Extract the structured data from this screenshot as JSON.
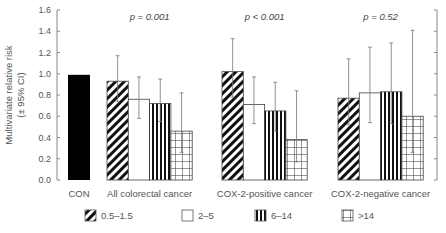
{
  "chart_data": {
    "type": "bar",
    "title": "",
    "xlabel": "",
    "ylabel": "Multivariate relative risk (± 95% CI)",
    "ylabel_lines": [
      "Multivariate relative risk",
      "(± 95% CI)"
    ],
    "ylim": [
      0,
      1.6
    ],
    "yticks": [
      "0.0",
      "0.2",
      "0.4",
      "0.6",
      "0.8",
      "1.0",
      "1.2",
      "1.4",
      "1.6"
    ],
    "grid": false,
    "legend_position": "bottom",
    "reference": {
      "name": "CON",
      "value": 0.99,
      "color": "#000000"
    },
    "categories": [
      "All colorectal cancer",
      "COX-2-positive cancer",
      "COX-2-negative cancer"
    ],
    "annotations": [
      "p = 0.001",
      "p < 0.001",
      "p = 0.52"
    ],
    "series": [
      {
        "name": "0.5–1.5",
        "pattern": "diagonal-hatch",
        "values": [
          0.93,
          1.02,
          0.77
        ],
        "ci_lower": [
          0.74,
          0.78,
          0.52
        ],
        "ci_upper": [
          1.17,
          1.33,
          1.14
        ]
      },
      {
        "name": "2–5",
        "pattern": "white",
        "values": [
          0.76,
          0.71,
          0.82
        ],
        "ci_lower": [
          0.58,
          0.53,
          0.54
        ],
        "ci_upper": [
          0.97,
          0.97,
          1.25
        ]
      },
      {
        "name": "6–14",
        "pattern": "vertical-stripes",
        "values": [
          0.72,
          0.65,
          0.83
        ],
        "ci_lower": [
          0.55,
          0.46,
          0.53
        ],
        "ci_upper": [
          0.95,
          0.92,
          1.29
        ]
      },
      {
        "name": ">14",
        "pattern": "grid",
        "values": [
          0.46,
          0.38,
          0.6
        ],
        "ci_lower": [
          0.26,
          0.17,
          0.26
        ],
        "ci_upper": [
          0.82,
          0.84,
          1.41
        ]
      }
    ]
  }
}
